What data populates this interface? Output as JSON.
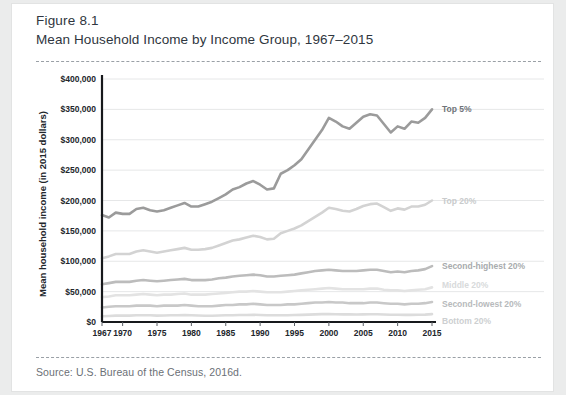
{
  "figure": {
    "label": "Figure 8.1",
    "title": "Mean Household Income by Income Group, 1967–2015",
    "source": "Source: U.S. Bureau of the Census, 2016d."
  },
  "chart_data": {
    "type": "line",
    "title": "Mean Household Income by Income Group, 1967–2015",
    "xlabel": "",
    "ylabel": "Mean household income (in 2015 dollars)",
    "xlim": [
      1967,
      2015
    ],
    "ylim": [
      0,
      400000
    ],
    "grid": true,
    "legend_position": "right-inline",
    "ytick_labels": [
      "$0",
      "$50,000",
      "$100,000",
      "$150,000",
      "$200,000",
      "$250,000",
      "$300,000",
      "$350,000",
      "$400,000"
    ],
    "ytick_values": [
      0,
      50000,
      100000,
      150000,
      200000,
      250000,
      300000,
      350000,
      400000
    ],
    "xtick_labels": [
      "1967",
      "1970",
      "1975",
      "1980",
      "1985",
      "1990",
      "1995",
      "2000",
      "2005",
      "2010",
      "2015"
    ],
    "xtick_values": [
      1967,
      1970,
      1975,
      1980,
      1985,
      1990,
      1995,
      2000,
      2005,
      2010,
      2015
    ],
    "x": [
      1967,
      1968,
      1969,
      1970,
      1971,
      1972,
      1973,
      1974,
      1975,
      1976,
      1977,
      1978,
      1979,
      1980,
      1981,
      1982,
      1983,
      1984,
      1985,
      1986,
      1987,
      1988,
      1989,
      1990,
      1991,
      1992,
      1993,
      1994,
      1995,
      1996,
      1997,
      1998,
      1999,
      2000,
      2001,
      2002,
      2003,
      2004,
      2005,
      2006,
      2007,
      2008,
      2009,
      2010,
      2011,
      2012,
      2013,
      2014,
      2015
    ],
    "series": [
      {
        "name": "Top 5%",
        "color": "#9b9b9b",
        "label_color": "#6f7479",
        "values": [
          176000,
          172000,
          180000,
          178000,
          178000,
          186000,
          188000,
          184000,
          182000,
          184000,
          188000,
          192000,
          196000,
          190000,
          190000,
          194000,
          198000,
          204000,
          210000,
          218000,
          222000,
          228000,
          232000,
          226000,
          218000,
          220000,
          244000,
          250000,
          258000,
          268000,
          284000,
          300000,
          316000,
          336000,
          330000,
          322000,
          318000,
          328000,
          338000,
          342000,
          340000,
          326000,
          312000,
          322000,
          318000,
          330000,
          328000,
          336000,
          350000
        ]
      },
      {
        "name": "Top 20%",
        "color": "#d3d3d3",
        "label_color": "#c9cbcc",
        "values": [
          105000,
          108000,
          112000,
          112000,
          112000,
          116000,
          118000,
          116000,
          114000,
          116000,
          118000,
          120000,
          122000,
          119000,
          119000,
          120000,
          122000,
          126000,
          130000,
          134000,
          136000,
          139000,
          142000,
          140000,
          136000,
          137000,
          146000,
          150000,
          154000,
          159000,
          166000,
          173000,
          180000,
          188000,
          186000,
          183000,
          182000,
          186000,
          191000,
          194000,
          195000,
          189000,
          183000,
          187000,
          185000,
          190000,
          190000,
          193000,
          200000
        ]
      },
      {
        "name": "Second-highest 20%",
        "color": "#bcbcbc",
        "label_color": "#a8abad",
        "values": [
          62000,
          64000,
          66000,
          66000,
          66000,
          68000,
          69000,
          68000,
          67000,
          68000,
          69000,
          70000,
          71000,
          69000,
          69000,
          69000,
          70000,
          72000,
          73000,
          75000,
          76000,
          77000,
          78000,
          77000,
          75000,
          75000,
          76000,
          77000,
          78000,
          80000,
          82000,
          84000,
          85000,
          86000,
          85000,
          84000,
          84000,
          84000,
          85000,
          86000,
          86000,
          84000,
          82000,
          83000,
          82000,
          84000,
          85000,
          87000,
          92000
        ]
      },
      {
        "name": "Middle 20%",
        "color": "#e3e3e3",
        "label_color": "#d8dadb",
        "values": [
          41000,
          42000,
          44000,
          44000,
          44000,
          45000,
          46000,
          45000,
          44000,
          45000,
          45000,
          46000,
          47000,
          45000,
          45000,
          45000,
          46000,
          47000,
          48000,
          49000,
          50000,
          50000,
          51000,
          50000,
          49000,
          49000,
          49000,
          50000,
          51000,
          52000,
          53000,
          54000,
          55000,
          56000,
          55000,
          54000,
          54000,
          54000,
          54000,
          55000,
          55000,
          53000,
          52000,
          52000,
          51000,
          52000,
          53000,
          54000,
          57000
        ]
      },
      {
        "name": "Second-lowest 20%",
        "color": "#c8c8c8",
        "label_color": "#b7babc",
        "values": [
          24000,
          25000,
          26000,
          26000,
          26000,
          27000,
          27000,
          27000,
          26000,
          27000,
          27000,
          27000,
          28000,
          27000,
          26000,
          26000,
          26000,
          27000,
          28000,
          28000,
          29000,
          29000,
          30000,
          29000,
          28000,
          28000,
          28000,
          29000,
          29000,
          30000,
          31000,
          32000,
          32000,
          33000,
          32000,
          32000,
          31000,
          31000,
          31000,
          32000,
          32000,
          31000,
          30000,
          30000,
          29000,
          30000,
          30000,
          31000,
          33000
        ]
      },
      {
        "name": "Bottom 20%",
        "color": "#dcdcdc",
        "label_color": "#cdcfd1",
        "values": [
          9500,
          10000,
          10500,
          10500,
          10500,
          11000,
          11000,
          11000,
          10500,
          10800,
          11000,
          11200,
          11400,
          11000,
          10600,
          10400,
          10400,
          10700,
          11000,
          11200,
          11500,
          11600,
          11900,
          11600,
          11200,
          11100,
          11000,
          11200,
          11500,
          11800,
          12200,
          12600,
          12900,
          13100,
          12800,
          12600,
          12500,
          12400,
          12500,
          12700,
          12800,
          12400,
          12000,
          11900,
          11700,
          11800,
          11900,
          12200,
          13000
        ]
      }
    ]
  }
}
